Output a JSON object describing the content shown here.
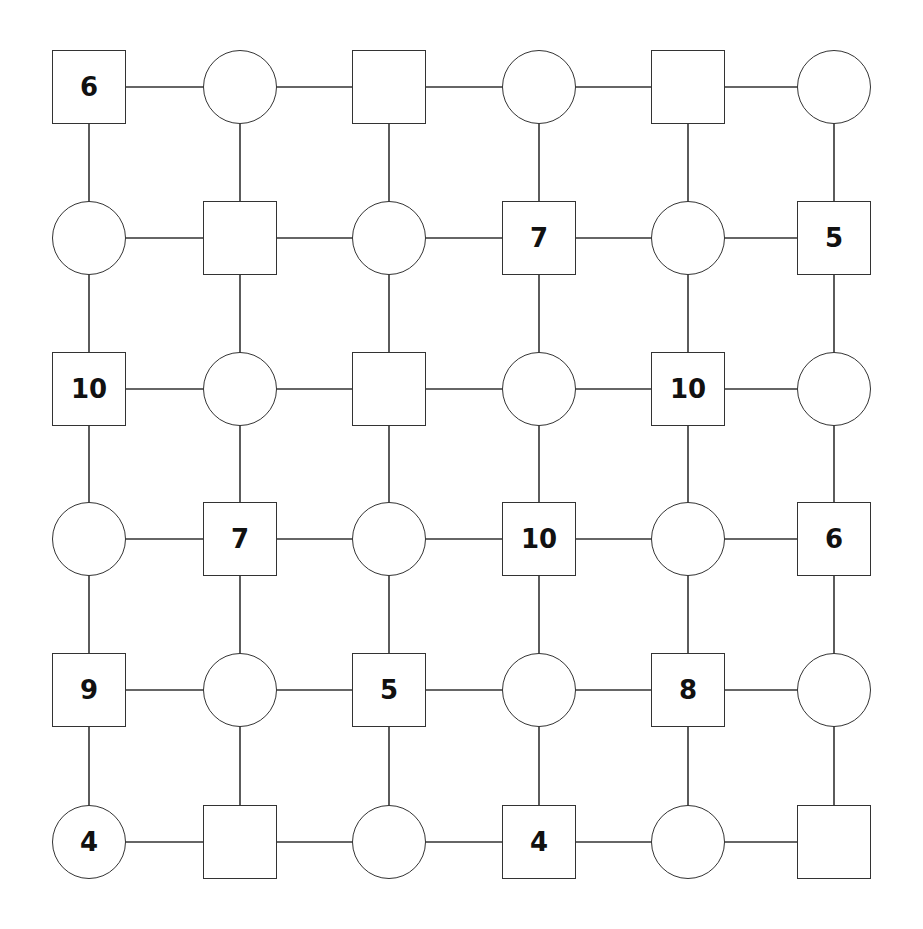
{
  "puzzle": {
    "rows": 6,
    "cols": 6,
    "line_color": "#333333",
    "grid": [
      [
        {
          "shape": "square",
          "value": "6"
        },
        {
          "shape": "circle",
          "value": ""
        },
        {
          "shape": "square",
          "value": ""
        },
        {
          "shape": "circle",
          "value": ""
        },
        {
          "shape": "square",
          "value": ""
        },
        {
          "shape": "circle",
          "value": ""
        }
      ],
      [
        {
          "shape": "circle",
          "value": ""
        },
        {
          "shape": "square",
          "value": ""
        },
        {
          "shape": "circle",
          "value": ""
        },
        {
          "shape": "square",
          "value": "7"
        },
        {
          "shape": "circle",
          "value": ""
        },
        {
          "shape": "square",
          "value": "5"
        }
      ],
      [
        {
          "shape": "square",
          "value": "10"
        },
        {
          "shape": "circle",
          "value": ""
        },
        {
          "shape": "square",
          "value": ""
        },
        {
          "shape": "circle",
          "value": ""
        },
        {
          "shape": "square",
          "value": "10"
        },
        {
          "shape": "circle",
          "value": ""
        }
      ],
      [
        {
          "shape": "circle",
          "value": ""
        },
        {
          "shape": "square",
          "value": "7"
        },
        {
          "shape": "circle",
          "value": ""
        },
        {
          "shape": "square",
          "value": "10"
        },
        {
          "shape": "circle",
          "value": ""
        },
        {
          "shape": "square",
          "value": "6"
        }
      ],
      [
        {
          "shape": "square",
          "value": "9"
        },
        {
          "shape": "circle",
          "value": ""
        },
        {
          "shape": "square",
          "value": "5"
        },
        {
          "shape": "circle",
          "value": ""
        },
        {
          "shape": "square",
          "value": "8"
        },
        {
          "shape": "circle",
          "value": ""
        }
      ],
      [
        {
          "shape": "circle",
          "value": "4"
        },
        {
          "shape": "square",
          "value": ""
        },
        {
          "shape": "circle",
          "value": ""
        },
        {
          "shape": "square",
          "value": "4"
        },
        {
          "shape": "circle",
          "value": ""
        },
        {
          "shape": "square",
          "value": ""
        }
      ]
    ]
  }
}
